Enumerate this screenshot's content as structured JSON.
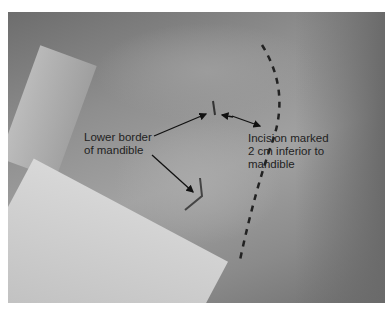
{
  "figure": {
    "annotations": [
      {
        "id": "lower-border",
        "lines": [
          "Lower border",
          "of mandible"
        ]
      },
      {
        "id": "incision",
        "lines": [
          "Incision marked",
          "2 cm inferior to",
          "mandible"
        ]
      }
    ]
  }
}
